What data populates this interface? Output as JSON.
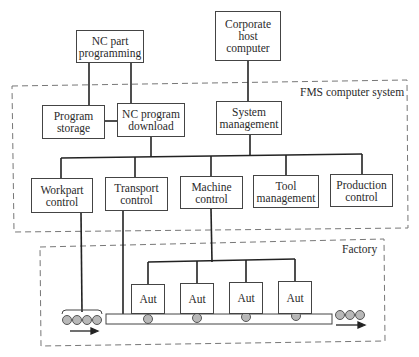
{
  "diagram": {
    "type": "hierarchical-block-diagram",
    "regions": {
      "fms": {
        "label": "FMS computer system"
      },
      "factory": {
        "label": "Factory"
      }
    },
    "external_nodes": {
      "nc_part_programming": "NC part\nprogramming",
      "corporate_host": "Corporate\nhost\ncomputer"
    },
    "fms_nodes": {
      "program_storage": "Program\nstorage",
      "nc_program_download": "NC program\ndownload",
      "system_management": "System\nmanagement"
    },
    "control_modules": [
      {
        "id": "workpart",
        "label": "Workpart\ncontrol"
      },
      {
        "id": "transport",
        "label": "Transport\ncontrol"
      },
      {
        "id": "machine",
        "label": "Machine\ncontrol"
      },
      {
        "id": "tool",
        "label": "Tool\nmanagement"
      },
      {
        "id": "production",
        "label": "Production\ncontrol"
      }
    ],
    "machines": [
      {
        "label": "Aut"
      },
      {
        "label": "Aut"
      },
      {
        "label": "Aut"
      },
      {
        "label": "Aut"
      }
    ],
    "edges": [
      [
        "NC part programming",
        "Program storage"
      ],
      [
        "NC part programming",
        "NC program download"
      ],
      [
        "Program storage",
        "NC program download"
      ],
      [
        "Corporate host computer",
        "System management"
      ],
      [
        "NC program download",
        "control bus"
      ],
      [
        "System management",
        "control bus"
      ],
      [
        "control bus",
        "Workpart control"
      ],
      [
        "control bus",
        "Transport control"
      ],
      [
        "control bus",
        "Machine control"
      ],
      [
        "control bus",
        "Tool management"
      ],
      [
        "control bus",
        "Production control"
      ],
      [
        "Workpart control",
        "Incoming workparts"
      ],
      [
        "Transport control",
        "Conveyor"
      ],
      [
        "Machine control",
        "Aut machines"
      ]
    ],
    "colors": {
      "line": "#222222",
      "box_border": "#444444",
      "dashed_border": "#777777",
      "pallet_fill": "#b8b8b8"
    }
  }
}
